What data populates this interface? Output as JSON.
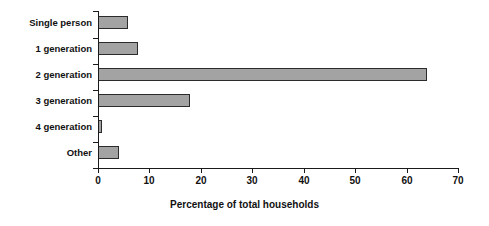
{
  "chart_data": {
    "type": "bar",
    "orientation": "horizontal",
    "title": "",
    "xlabel": "Percentage of total households",
    "ylabel": "",
    "categories": [
      "Single person",
      "1 generation",
      "2 generation",
      "3 generation",
      "4 generation",
      "Other"
    ],
    "values": [
      5.8,
      7.7,
      64.0,
      17.8,
      0.7,
      4.0
    ],
    "xlim": [
      0,
      70
    ],
    "xticks": [
      0,
      10,
      20,
      30,
      40,
      50,
      60,
      70
    ],
    "xtick_labels": [
      "0",
      "10",
      "20",
      "30",
      "40",
      "50",
      "60",
      "70"
    ],
    "grid": false,
    "legend": null,
    "bar_fill_color": "#a3a3a3",
    "bar_border_color": "#2b2b2b",
    "axis_color": "#1a1a1a",
    "background_color": "#ffffff"
  }
}
